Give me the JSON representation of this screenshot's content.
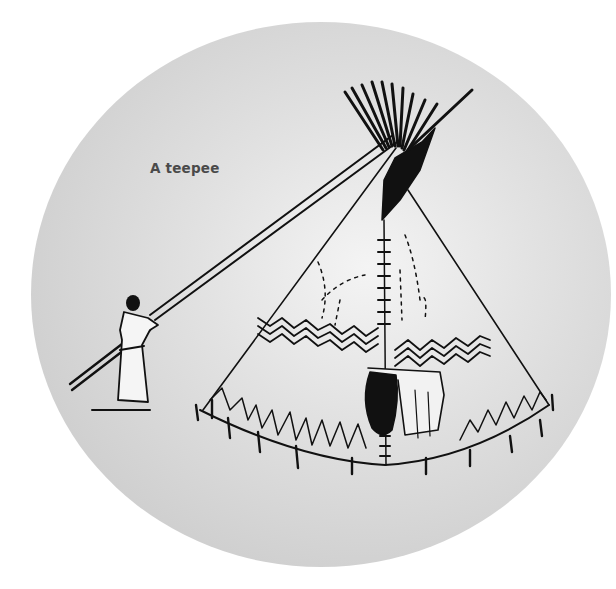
{
  "illustration": {
    "caption": "A teepee",
    "subject": "teepee-with-person-raising-pole",
    "colors": {
      "background": "#ffffff",
      "disc": "#d6d6d6",
      "disc_highlight": "#f4f4f4",
      "ink": "#111111",
      "caption": "#4a4a4a"
    }
  }
}
